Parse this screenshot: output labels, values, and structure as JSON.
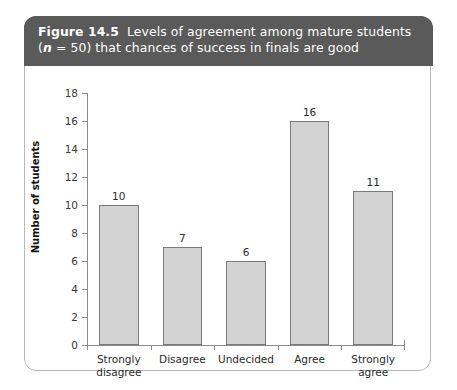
{
  "figure": {
    "label": "Figure 14.5",
    "title_line1": "Levels of agreement among mature students",
    "title_line2_pre": "(",
    "title_n_italic": "n",
    "title_line2_post": " = 50) that chances of success in finals are good",
    "header_bg": "#5a5a5a",
    "header_text_color": "#ffffff",
    "card_border": "#b9b9b9"
  },
  "chart_data": {
    "type": "bar",
    "categories": [
      "Strongly\ndisagree",
      "Disagree",
      "Undecided",
      "Agree",
      "Strongly\nagree"
    ],
    "values": [
      10,
      7,
      6,
      16,
      11
    ],
    "data_labels": [
      "10",
      "7",
      "6",
      "16",
      "11"
    ],
    "xlabel": "",
    "ylabel": "Number of students",
    "ylim": [
      0,
      18
    ],
    "ytick_step": 2,
    "yticks": [
      "0",
      "2",
      "4",
      "6",
      "8",
      "10",
      "12",
      "14",
      "16",
      "18"
    ],
    "grid": false,
    "legend": false,
    "bar_fill": "#d3d3d3",
    "bar_edge": "#7a7a7a",
    "axis_color": "#8a8a8a",
    "n_total": 50
  }
}
